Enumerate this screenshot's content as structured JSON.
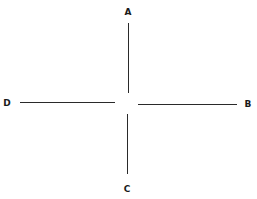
{
  "diagram": {
    "type": "cross",
    "line_color": "#2a2a2a",
    "labels": {
      "top": "A",
      "right": "B",
      "bottom": "C",
      "left": "D"
    }
  }
}
